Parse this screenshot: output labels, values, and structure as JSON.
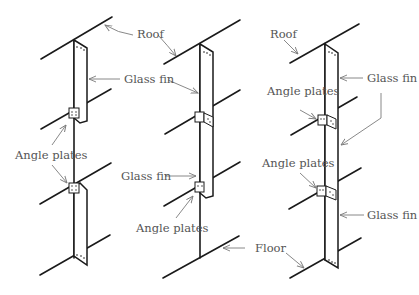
{
  "diagram": {
    "panels": [
      {
        "id": "left",
        "labels": {
          "roof": "Roof",
          "glass_fin_top": "Glass fin",
          "angle_plates": "Angle plates"
        }
      },
      {
        "id": "middle",
        "labels": {
          "glass_fin": "Glass fin",
          "angle_plates": "Angle plates",
          "floor": "Floor"
        }
      },
      {
        "id": "right",
        "labels": {
          "roof": "Roof",
          "angle_plates_top": "Angle plates",
          "glass_fin_top": "Glass fin",
          "angle_plates_bottom": "Angle plates",
          "glass_fin_bottom": "Glass fin"
        }
      }
    ],
    "colors": {
      "line": "#1a1a1a",
      "label": "#555555",
      "leader": "#7a7a7a"
    }
  }
}
